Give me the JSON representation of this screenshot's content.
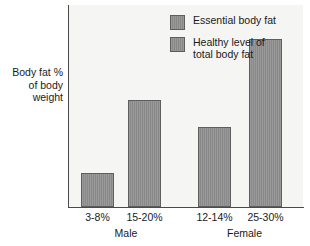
{
  "chart_data": {
    "type": "bar",
    "title": "",
    "xlabel": "",
    "ylabel": "Body fat %\nof body\nweight",
    "ylim": [
      0,
      33
    ],
    "grid": false,
    "legend_position": "top-right",
    "categories": [
      "3-8%",
      "15-20%",
      "12-14%",
      "25-30%"
    ],
    "groups": [
      {
        "name": "Male",
        "categories": [
          "3-8%",
          "15-20%"
        ]
      },
      {
        "name": "Female",
        "categories": [
          "12-14%",
          "25-30%"
        ]
      }
    ],
    "series": [
      {
        "name": "Essential body fat",
        "color": "#8f8f8f",
        "points": [
          {
            "group": "Male",
            "label": "3-8%",
            "value": 5.5
          },
          {
            "group": "Female",
            "label": "12-14%",
            "value": 13
          }
        ]
      },
      {
        "name": "Healthy level of\ntotal body fat",
        "color": "#8f8f8f",
        "points": [
          {
            "group": "Male",
            "label": "15-20%",
            "value": 17.5
          },
          {
            "group": "Female",
            "label": "25-30%",
            "value": 27.5
          }
        ]
      }
    ],
    "bars": [
      {
        "label": "3-8%",
        "group": "Male",
        "series": "Essential body fat",
        "value": 5.5,
        "x": 81,
        "width": 33
      },
      {
        "label": "15-20%",
        "group": "Male",
        "series": "Healthy level of total body fat",
        "value": 17.5,
        "x": 128,
        "width": 33
      },
      {
        "label": "12-14%",
        "group": "Female",
        "series": "Essential body fat",
        "value": 13,
        "x": 198,
        "width": 33
      },
      {
        "label": "25-30%",
        "group": "Female",
        "series": "Healthy level of total body fat",
        "value": 27.5,
        "x": 249,
        "width": 33
      }
    ]
  },
  "legend": {
    "items": [
      {
        "label": "Essential body fat"
      },
      {
        "label": "Healthy level of\ntotal body fat"
      }
    ]
  },
  "axis": {
    "y_caption": "Body fat %\nof body\nweight",
    "tick_labels": [
      "3-8%",
      "15-20%",
      "12-14%",
      "25-30%"
    ],
    "group_labels": [
      "Male",
      "Female"
    ]
  },
  "colors": {
    "bar_fill": "#8f8f8f",
    "bar_border": "#5e5e5e",
    "plot_background": "#f5f5f3",
    "axis_line": "#4a4a4a",
    "text": "#1a1a1a"
  }
}
